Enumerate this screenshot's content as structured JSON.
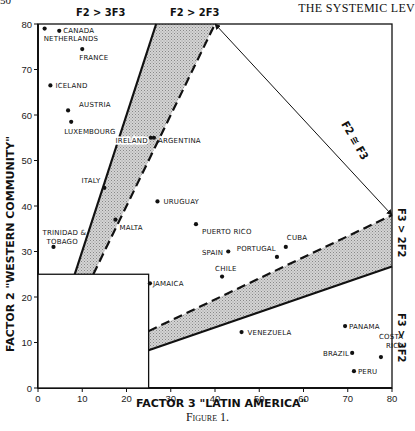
{
  "page": {
    "number_fragment": "50",
    "running_head": "THE SYSTEMIC LEV",
    "caption": "Figure 1."
  },
  "chart_data": {
    "type": "scatter",
    "title": "",
    "xlabel": "FACTOR 3   \"LATIN AMERICA\"",
    "ylabel": "FACTOR 2   \"WESTERN COMMUNITY\"",
    "xlim": [
      0,
      80
    ],
    "ylim": [
      0,
      80
    ],
    "xticks": [
      0,
      10,
      20,
      30,
      40,
      50,
      60,
      70,
      80
    ],
    "yticks": [
      0,
      10,
      20,
      30,
      40,
      50,
      60,
      70,
      80
    ],
    "grid": false,
    "points": [
      {
        "name": "",
        "x": 1.5,
        "y": 79
      },
      {
        "name": "CANADA",
        "x": 4.8,
        "y": 78.5
      },
      {
        "name": "NETHERLANDS",
        "x": 1.5,
        "y": 79
      },
      {
        "name": "FRANCE",
        "x": 10,
        "y": 74.5
      },
      {
        "name": "ICELAND",
        "x": 2.8,
        "y": 66.5
      },
      {
        "name": "AUSTRIA",
        "x": 6.8,
        "y": 61
      },
      {
        "name": "LUXEMBOURG",
        "x": 7.5,
        "y": 58.5
      },
      {
        "name": "IRELAND",
        "x": 25.5,
        "y": 55
      },
      {
        "name": "ARGENTINA",
        "x": 26.2,
        "y": 55
      },
      {
        "name": "ITALY",
        "x": 15,
        "y": 44
      },
      {
        "name": "MALTA",
        "x": 17.5,
        "y": 37
      },
      {
        "name": "URUGUAY",
        "x": 27,
        "y": 41
      },
      {
        "name": "TRINIDAD & TOBAGO",
        "x": 3.5,
        "y": 31
      },
      {
        "name": "PUERTO RICO",
        "x": 35.7,
        "y": 36
      },
      {
        "name": "SPAIN",
        "x": 43,
        "y": 30
      },
      {
        "name": "PORTUGAL",
        "x": 54,
        "y": 28.8
      },
      {
        "name": "CUBA",
        "x": 56,
        "y": 31
      },
      {
        "name": "CHILE",
        "x": 41.6,
        "y": 24.5
      },
      {
        "name": "JAMAICA",
        "x": 25.3,
        "y": 23
      },
      {
        "name": "VENEZUELA",
        "x": 46,
        "y": 12.3
      },
      {
        "name": "PANAMA",
        "x": 69.4,
        "y": 13.6
      },
      {
        "name": "BRAZIL",
        "x": 71,
        "y": 7.7
      },
      {
        "name": "COSTA RICA",
        "x": 77.5,
        "y": 6.8
      },
      {
        "name": "PERU",
        "x": 71.4,
        "y": 3.7
      }
    ],
    "reference_lines": [
      {
        "label": "F2 > 3F3",
        "style": "solid",
        "from": [
          8.3,
          25
        ],
        "to": [
          26.7,
          80
        ]
      },
      {
        "label": "F2 > 2F3",
        "style": "dashed",
        "from": [
          12.5,
          25
        ],
        "to": [
          40,
          80
        ]
      },
      {
        "label": "F2 = F3",
        "style": "arrow",
        "from": [
          40,
          80
        ],
        "to": [
          80,
          38
        ]
      },
      {
        "label": "F3 > 2F2",
        "style": "dashed",
        "from": [
          25,
          12.5
        ],
        "to": [
          80,
          38
        ]
      },
      {
        "label": "F3 > 3F2",
        "style": "solid",
        "from": [
          25,
          8.3
        ],
        "to": [
          80,
          26.7
        ]
      }
    ],
    "shaded_regions": [
      {
        "between": [
          "F2 > 3F3",
          "F2 > 2F3"
        ],
        "fill": "stippled gray"
      },
      {
        "between": [
          "F3 > 2F2",
          "F3 > 3F2"
        ],
        "fill": "stippled gray"
      }
    ],
    "excluded_box": {
      "x": [
        0,
        25
      ],
      "y": [
        0,
        25
      ]
    },
    "annotations": {
      "top_left": "F2 > 3F3",
      "top_mid": "F2 > 2F3",
      "diagonal": "F2 ≅ F3",
      "right_upper": "F3 > 2F2",
      "right_lower": "F3 > 3F2"
    }
  }
}
